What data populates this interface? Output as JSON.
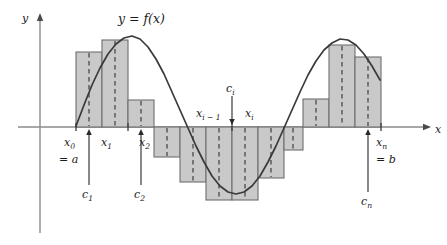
{
  "figure": {
    "title_label": "y = f(x)",
    "axis_labels": {
      "y": "y",
      "x": "x"
    },
    "colors": {
      "bar_fill": "#c9c9c9",
      "bar_stroke": "#6e6e6e",
      "curve": "#3a3a3a",
      "axis": "#8a8a8a",
      "dashed": "#4a4a4a",
      "text": "#1a1a1a",
      "background": "#ffffff"
    },
    "tick_labels": [
      {
        "id": "x0",
        "base": "x",
        "sub": "0",
        "extra": "= a"
      },
      {
        "id": "x1",
        "base": "x",
        "sub": "1",
        "extra": ""
      },
      {
        "id": "x2",
        "base": "x",
        "sub": "2",
        "extra": ""
      },
      {
        "id": "xi-1",
        "base": "x",
        "sub": "i − 1",
        "extra": ""
      },
      {
        "id": "xi",
        "base": "x",
        "sub": "i",
        "extra": ""
      },
      {
        "id": "xn",
        "base": "x",
        "sub": "n",
        "extra": "= b"
      }
    ],
    "sample_labels": [
      {
        "id": "c1",
        "base": "c",
        "sub": "1"
      },
      {
        "id": "c2",
        "base": "c",
        "sub": "2"
      },
      {
        "id": "ci",
        "base": "c",
        "sub": "i"
      },
      {
        "id": "cn",
        "base": "c",
        "sub": "n"
      }
    ]
  },
  "chart_data": {
    "type": "bar",
    "title": "y = f(x)",
    "xlabel": "x",
    "ylabel": "y",
    "grid": false,
    "legend": "none",
    "axis_y_pixel": 127,
    "axis_x_range_px": [
      76,
      381
    ],
    "curve": {
      "name": "f(x)",
      "type": "line",
      "style": "solid",
      "points_px": [
        [
          76,
          126
        ],
        [
          84,
          105
        ],
        [
          92,
          85
        ],
        [
          100,
          68
        ],
        [
          108,
          54
        ],
        [
          116,
          44
        ],
        [
          124,
          38
        ],
        [
          132,
          36
        ],
        [
          140,
          39
        ],
        [
          148,
          47
        ],
        [
          156,
          59
        ],
        [
          164,
          74
        ],
        [
          172,
          92
        ],
        [
          180,
          110
        ],
        [
          188,
          128
        ],
        [
          196,
          146
        ],
        [
          204,
          162
        ],
        [
          212,
          176
        ],
        [
          220,
          186
        ],
        [
          228,
          192
        ],
        [
          236,
          194
        ],
        [
          244,
          192
        ],
        [
          252,
          186
        ],
        [
          260,
          176
        ],
        [
          268,
          162
        ],
        [
          276,
          146
        ],
        [
          284,
          128
        ],
        [
          292,
          110
        ],
        [
          300,
          92
        ],
        [
          308,
          75
        ],
        [
          316,
          61
        ],
        [
          324,
          50
        ],
        [
          332,
          43
        ],
        [
          340,
          39
        ],
        [
          348,
          40
        ],
        [
          356,
          45
        ],
        [
          364,
          54
        ],
        [
          372,
          66
        ],
        [
          380,
          80
        ]
      ]
    },
    "bars": [
      {
        "index": 1,
        "x0_px": 76,
        "x1_px": 102,
        "top_px": 52,
        "bottom_px": 127,
        "sample_px": 89,
        "sign": "positive"
      },
      {
        "index": 2,
        "x0_px": 102,
        "x1_px": 128,
        "top_px": 40,
        "bottom_px": 127,
        "sample_px": 115,
        "sign": "positive"
      },
      {
        "index": 3,
        "x0_px": 128,
        "x1_px": 154,
        "top_px": 100,
        "bottom_px": 127,
        "sample_px": 141,
        "sign": "positive"
      },
      {
        "index": 4,
        "x0_px": 154,
        "x1_px": 180,
        "top_px": 127,
        "bottom_px": 157,
        "sample_px": 167,
        "sign": "negative"
      },
      {
        "index": 5,
        "x0_px": 180,
        "x1_px": 206,
        "top_px": 127,
        "bottom_px": 182,
        "sample_px": 193,
        "sign": "negative"
      },
      {
        "index": 6,
        "x0_px": 206,
        "x1_px": 232,
        "top_px": 127,
        "bottom_px": 200,
        "sample_px": 219,
        "sign": "negative"
      },
      {
        "index": 7,
        "x0_px": 232,
        "x1_px": 258,
        "top_px": 127,
        "bottom_px": 200,
        "sample_px": 245,
        "sign": "negative"
      },
      {
        "index": 8,
        "x0_px": 258,
        "x1_px": 284,
        "top_px": 127,
        "bottom_px": 178,
        "sample_px": 271,
        "sign": "negative"
      },
      {
        "index": 9,
        "x0_px": 284,
        "x1_px": 303,
        "top_px": 127,
        "bottom_px": 150,
        "sample_px": 293,
        "sign": "negative"
      },
      {
        "index": 10,
        "x0_px": 303,
        "x1_px": 329,
        "top_px": 99,
        "bottom_px": 127,
        "sample_px": 316,
        "sign": "positive"
      },
      {
        "index": 11,
        "x0_px": 329,
        "x1_px": 355,
        "top_px": 45,
        "bottom_px": 127,
        "sample_px": 342,
        "sign": "positive"
      },
      {
        "index": 12,
        "x0_px": 355,
        "x1_px": 381,
        "top_px": 57,
        "bottom_px": 127,
        "sample_px": 368,
        "sign": "positive"
      }
    ],
    "ticks_px": [
      76,
      128,
      232,
      381
    ],
    "sample_arrows_px": [
      {
        "id": "c1",
        "x_px": 89,
        "from_y_px": 185,
        "to_y_px": 129
      },
      {
        "id": "c2",
        "x_px": 141,
        "from_y_px": 185,
        "to_y_px": 129
      },
      {
        "id": "ci",
        "x_px": 232,
        "from_y_px": 96,
        "to_y_px": 125
      },
      {
        "id": "cn",
        "x_px": 368,
        "from_y_px": 192,
        "to_y_px": 129
      }
    ]
  }
}
